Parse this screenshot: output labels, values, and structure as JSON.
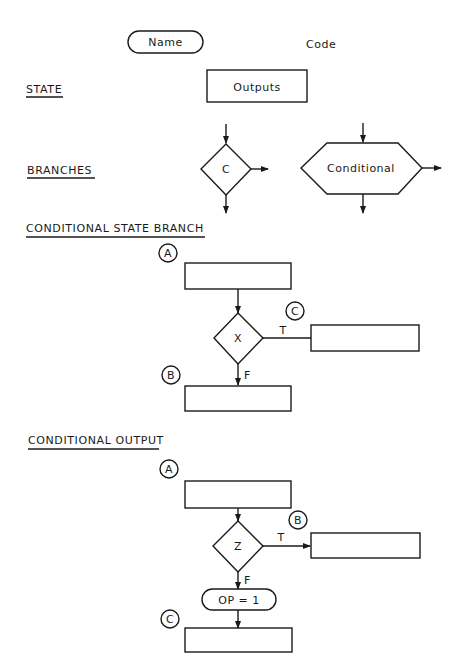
{
  "legend": {
    "name_label": "Name",
    "code_label": "Code",
    "state_heading": "STATE",
    "outputs_label": "Outputs",
    "branches_heading": "BRANCHES",
    "branch_diamond_label": "C",
    "branch_hex_label": "Conditional"
  },
  "conditional_state_branch": {
    "heading": "CONDITIONAL STATE BRANCH",
    "connector_a": "A",
    "connector_b": "B",
    "connector_c": "C",
    "decision_label": "X",
    "true_label": "T",
    "false_label": "F"
  },
  "conditional_output": {
    "heading": "CONDITIONAL OUTPUT",
    "connector_a": "A",
    "connector_b": "B",
    "connector_c": "C",
    "decision_label": "Z",
    "true_label": "T",
    "false_label": "F",
    "output_label": "OP = 1"
  }
}
